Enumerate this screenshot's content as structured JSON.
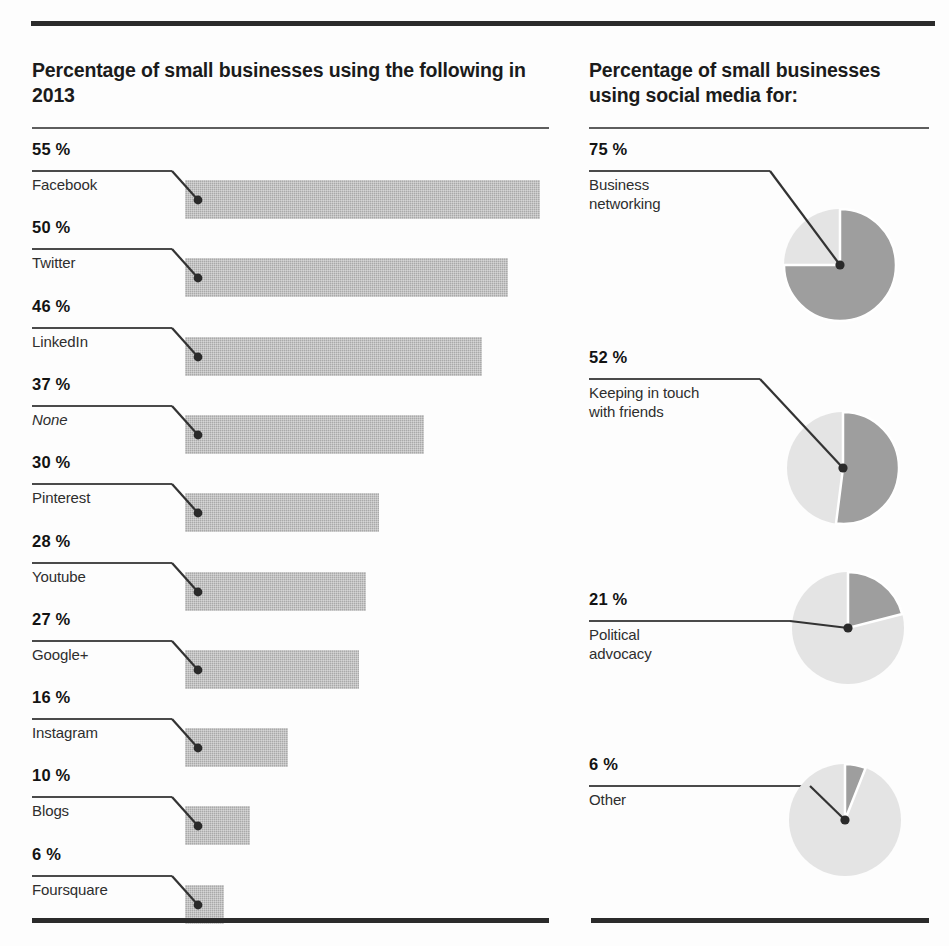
{
  "chart_data": [
    {
      "type": "bar",
      "title": "Percentage of small businesses using the following in 2013",
      "orientation": "horizontal",
      "xlabel": "",
      "ylabel": "",
      "xlim": [
        0,
        55
      ],
      "grid": false,
      "legend": "none",
      "value_suffix": "%",
      "categories": [
        "Facebook",
        "Twitter",
        "LinkedIn",
        "None",
        "Pinterest",
        "Youtube",
        "Google+",
        "Instagram",
        "Blogs",
        "Foursquare"
      ],
      "values": [
        55,
        50,
        46,
        37,
        30,
        28,
        27,
        16,
        10,
        6
      ],
      "value_labels": [
        "55 %",
        "50 %",
        "46 %",
        "37 %",
        "30 %",
        "28 %",
        "27 %",
        "16 %",
        "10 %",
        "6 %"
      ],
      "bar_color": "#a9a9a9"
    },
    {
      "type": "pie",
      "title": "Percentage of small businesses using social media for:",
      "note": "four separate single-value pies, dark slice starts at 12 o'clock clockwise",
      "value_suffix": "%",
      "categories": [
        "Business networking",
        "Keeping in touch with friends",
        "Political advocacy",
        "Other"
      ],
      "values": [
        75,
        52,
        21,
        6
      ],
      "value_labels": [
        "75 %",
        "52 %",
        "21 %",
        "6 %"
      ],
      "slice_color": "#9e9e9e",
      "remainder_color": "#e4e4e4"
    }
  ],
  "left": {
    "title": "Percentage of small businesses using\nthe following in 2013",
    "items": [
      {
        "pct": "55 %",
        "label": "Facebook",
        "value": 55,
        "italic": false
      },
      {
        "pct": "50 %",
        "label": "Twitter",
        "value": 50,
        "italic": false
      },
      {
        "pct": "46 %",
        "label": "LinkedIn",
        "value": 46,
        "italic": false
      },
      {
        "pct": "37 %",
        "label": "None",
        "value": 37,
        "italic": true
      },
      {
        "pct": "30 %",
        "label": "Pinterest",
        "value": 30,
        "italic": false
      },
      {
        "pct": "28 %",
        "label": "Youtube",
        "value": 28,
        "italic": false
      },
      {
        "pct": "27 %",
        "label": "Google+",
        "value": 27,
        "italic": false
      },
      {
        "pct": "16 %",
        "label": "Instagram",
        "value": 16,
        "italic": false
      },
      {
        "pct": "10 %",
        "label": "Blogs",
        "value": 10,
        "italic": false
      },
      {
        "pct": "6 %",
        "label": "Foursquare",
        "value": 6,
        "italic": false
      }
    ]
  },
  "right": {
    "title": "Percentage of small businesses\nusing social media for:",
    "items": [
      {
        "pct": "75 %",
        "label": "Business\nnetworking",
        "value": 75
      },
      {
        "pct": "52 %",
        "label": "Keeping in touch\nwith friends",
        "value": 52
      },
      {
        "pct": "21 %",
        "label": "Political\nadvocacy",
        "value": 21
      },
      {
        "pct": "6 %",
        "label": "Other",
        "value": 6
      }
    ]
  },
  "colors": {
    "rule_dark": "#2b2b2b",
    "bar_gray": "#a9a9a9",
    "pie_slice": "#9e9e9e",
    "pie_remainder": "#e4e4e4",
    "text": "#1b1b1b"
  }
}
